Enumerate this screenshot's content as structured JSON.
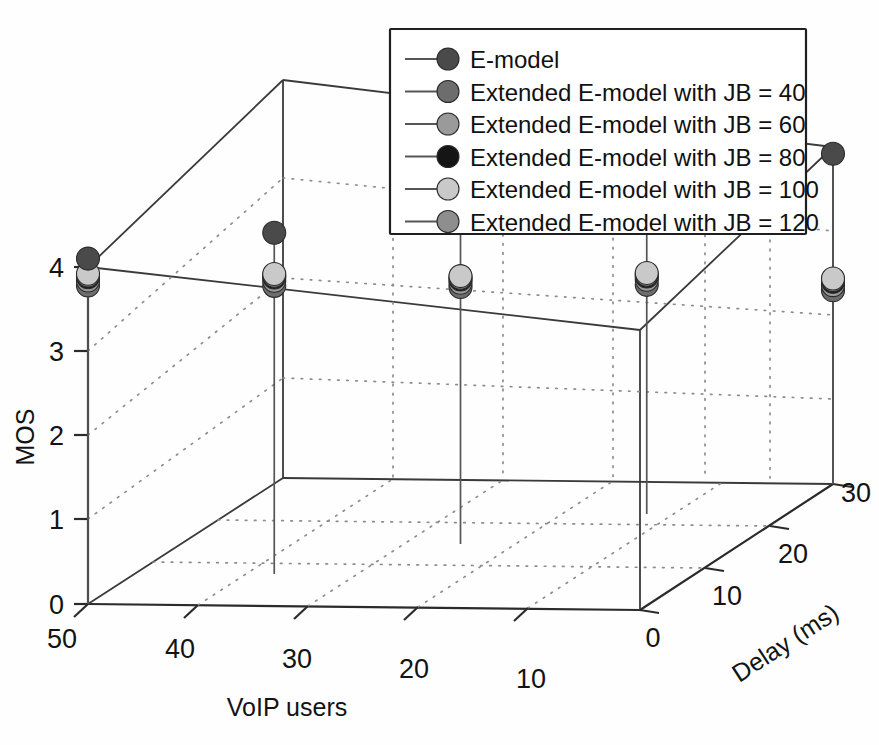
{
  "figure": {
    "background_color": "#ffffff",
    "width": 879,
    "height": 745
  },
  "chart_data": {
    "type": "scatter",
    "subtype": "stem3",
    "title": "",
    "xlabel": "VoIP users",
    "ylabel": "Delay (ms)",
    "zlabel": "MOS",
    "grid": true,
    "legend_position": "top-right",
    "axes": {
      "x": {
        "label": "VoIP users",
        "ticks": [
          50,
          40,
          30,
          20,
          10
        ],
        "tick_labels": [
          "50",
          "40",
          "30",
          "20",
          "10"
        ],
        "range": [
          50,
          10
        ],
        "direction": "descending"
      },
      "y": {
        "label": "Delay (ms)",
        "ticks": [
          0,
          10,
          20,
          30
        ],
        "tick_labels": [
          "0",
          "10",
          "20",
          "30"
        ],
        "range": [
          0,
          30
        ]
      },
      "z": {
        "label": "MOS",
        "ticks": [
          0,
          1,
          2,
          3,
          4
        ],
        "tick_labels": [
          "0",
          "1",
          "2",
          "3",
          "4"
        ],
        "range": [
          0,
          4
        ]
      }
    },
    "categories": [
      50,
      40,
      30,
      20,
      10
    ],
    "series": [
      {
        "name": "E-model",
        "color": "#4a4a4a",
        "marker": "circle",
        "values": [
          4.1,
          4.05,
          4.02,
          3.98,
          3.92
        ]
      },
      {
        "name": "Extended E-model with JB = 40",
        "color": "#6d6d6d",
        "marker": "circle",
        "values": [
          3.78,
          3.42,
          3.05,
          2.72,
          2.3
        ]
      },
      {
        "name": "Extended E-model with JB = 60",
        "color": "#9a9a9a",
        "marker": "circle",
        "values": [
          3.84,
          3.48,
          3.1,
          2.78,
          2.36
        ]
      },
      {
        "name": "Extended E-model with JB = 80",
        "color": "#151515",
        "marker": "circle",
        "values": [
          3.88,
          3.52,
          3.14,
          2.82,
          2.4
        ]
      },
      {
        "name": "Extended E-model with JB = 100",
        "color": "#c9c9c9",
        "marker": "circle",
        "values": [
          3.92,
          3.56,
          3.18,
          2.86,
          2.44
        ]
      },
      {
        "name": "Extended E-model with JB = 120",
        "color": "#8e8e8e",
        "marker": "circle",
        "values": [
          3.9,
          3.54,
          3.16,
          2.84,
          2.42
        ]
      }
    ]
  },
  "legend": {
    "items": [
      {
        "label": "E-model",
        "color": "#4a4a4a"
      },
      {
        "label": "Extended E-model with JB = 40",
        "color": "#6d6d6d"
      },
      {
        "label": "Extended E-model with JB = 60",
        "color": "#9a9a9a"
      },
      {
        "label": "Extended E-model with JB = 80",
        "color": "#151515"
      },
      {
        "label": "Extended E-model with JB = 100",
        "color": "#c9c9c9"
      },
      {
        "label": "Extended E-model with JB = 120",
        "color": "#8e8e8e"
      }
    ]
  },
  "axis_titles": {
    "z": "MOS",
    "x": "VoIP users",
    "y": "Delay (ms)"
  },
  "z_tick_labels": [
    "4",
    "3",
    "2",
    "1",
    "0"
  ],
  "x_tick_labels": [
    "50",
    "40",
    "30",
    "20",
    "10"
  ],
  "y_tick_labels": [
    "0",
    "10",
    "20",
    "30"
  ]
}
